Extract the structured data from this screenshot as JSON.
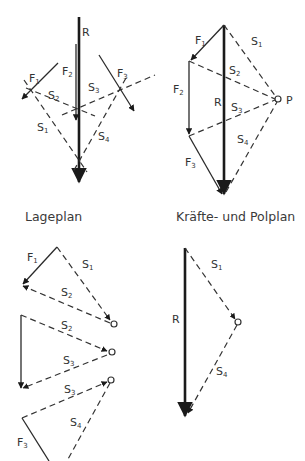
{
  "figure": {
    "captions": {
      "lageplan": "Lageplan",
      "polplan": "Kräfte- und Polplan"
    },
    "labels": {
      "R": "R",
      "F": "F",
      "S": "S",
      "P": "P",
      "sub1": "1",
      "sub2": "2",
      "sub3": "3",
      "sub4": "4"
    }
  },
  "colors": {
    "line": "#2a2a2a",
    "text": "#333333",
    "background": "#ffffff"
  }
}
